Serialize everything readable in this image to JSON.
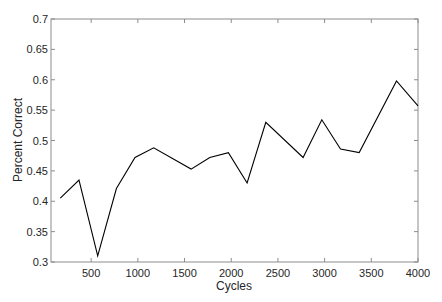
{
  "chart_data": {
    "type": "line",
    "title": "",
    "xlabel": "Cycles",
    "ylabel": "Percent Correct",
    "xlim": [
      70,
      4000
    ],
    "ylim": [
      0.3,
      0.7
    ],
    "x_ticks": [
      500,
      1000,
      1500,
      2000,
      2500,
      3000,
      3500,
      4000
    ],
    "x_tick_labels": [
      "500",
      "1000",
      "1500",
      "2000",
      "2500",
      "3000",
      "3500",
      "4000"
    ],
    "y_ticks": [
      0.3,
      0.35,
      0.4,
      0.45,
      0.5,
      0.55,
      0.6,
      0.65,
      0.7
    ],
    "y_tick_labels": [
      "0.3",
      "0.35",
      "0.4",
      "0.45",
      "0.5",
      "0.55",
      "0.6",
      "0.65",
      "0.7"
    ],
    "grid": false,
    "legend": null,
    "series": [
      {
        "name": "Percent Correct",
        "color": "#000000",
        "x": [
          170,
          370,
          570,
          770,
          970,
          1170,
          1570,
          1770,
          1970,
          2170,
          2370,
          2770,
          2970,
          3170,
          3370,
          3770,
          4000
        ],
        "values": [
          0.405,
          0.435,
          0.31,
          0.421,
          0.472,
          0.488,
          0.453,
          0.472,
          0.48,
          0.43,
          0.53,
          0.472,
          0.534,
          0.486,
          0.48,
          0.598,
          0.557
        ]
      }
    ]
  }
}
